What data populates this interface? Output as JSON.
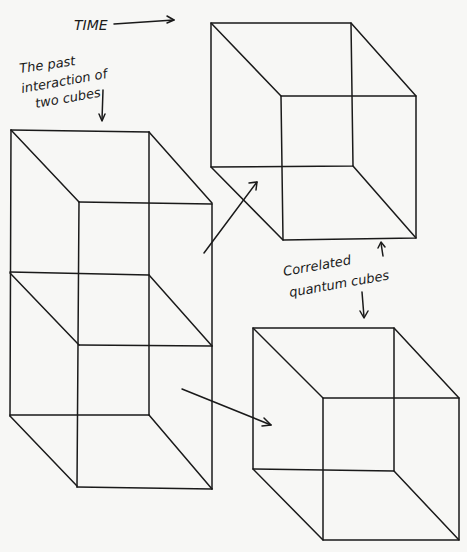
{
  "diagram": {
    "labels": {
      "time": "TIME",
      "past_line1": "The past",
      "past_line2": "interaction of",
      "past_line3": "two cubes",
      "correlated_line1": "Correlated",
      "correlated_line2": "quantum cubes"
    },
    "elements": [
      {
        "id": "time-arrow",
        "type": "arrow",
        "direction": "right"
      },
      {
        "id": "past-interaction-figure",
        "type": "two stacked wireframe cubes sharing a face"
      },
      {
        "id": "upper-correlated-cube",
        "type": "wireframe cube"
      },
      {
        "id": "lower-correlated-cube",
        "type": "wireframe cube"
      },
      {
        "id": "arrow-to-upper-cube",
        "type": "arrow"
      },
      {
        "id": "arrow-to-lower-cube",
        "type": "arrow"
      }
    ],
    "colors": {
      "ink": "#1a1a1a",
      "paper": "#f7f7f5"
    }
  }
}
